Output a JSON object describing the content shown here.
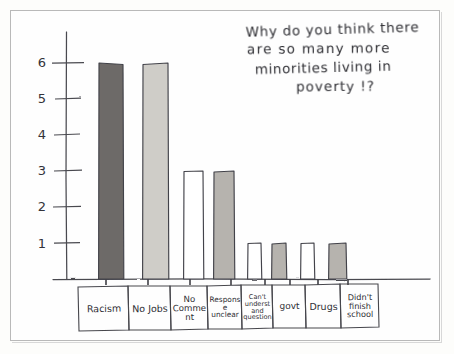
{
  "title": {
    "line1": "Why do you think there",
    "line2": "are so many more",
    "line3": "minorities living in",
    "line4": "poverty !?"
  },
  "axis": {
    "y_ticks": [
      "1",
      "2",
      "3",
      "4",
      "5",
      "6"
    ]
  },
  "colors": {
    "ink": "#3a3a40",
    "paper": "#fefefe",
    "bar_dark": "#6e6b68",
    "bar_light": "#cfcdc8",
    "bar_mid": "#b6b3ae",
    "bar_empty": "#ffffff",
    "frame": "#b9b9b9"
  },
  "chart_data": {
    "type": "bar",
    "title": "Why do you think there are so many more minorities living in poverty !?",
    "xlabel": "",
    "ylabel": "",
    "ylim": [
      0,
      6.6
    ],
    "grid": false,
    "legend": "none",
    "categories": [
      "Racism",
      "No Jobs",
      "No Comment",
      "Response unclear",
      "Can't understand question",
      "govt",
      "Drugs",
      "Didn't finish school"
    ],
    "values": [
      6,
      6,
      3,
      3,
      1,
      1,
      1,
      1
    ],
    "bar_fills": [
      "bar_dark",
      "bar_light",
      "bar_empty",
      "bar_mid",
      "bar_empty",
      "bar_mid",
      "bar_empty",
      "bar_mid"
    ]
  }
}
